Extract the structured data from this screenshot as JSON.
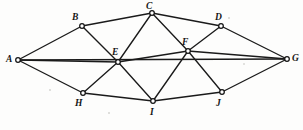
{
  "figure": {
    "width": 303,
    "height": 130,
    "background_color": "#fdfdfc",
    "line_color": "#1a1a1a",
    "vertex_fill_color": "#ffffff",
    "label_color": "#151515"
  },
  "chart_data": {
    "type": "diagram",
    "subtype": "undirected-graph",
    "title": "",
    "vertex_count": 10,
    "edge_count": 19,
    "vertices": [
      {
        "id": "A",
        "label": "A",
        "x": 18,
        "y": 60,
        "label_x": 6,
        "label_y": 55,
        "degree": 4
      },
      {
        "id": "B",
        "label": "B",
        "x": 82,
        "y": 26,
        "label_x": 72,
        "label_y": 13,
        "degree": 3
      },
      {
        "id": "C",
        "label": "C",
        "x": 152,
        "y": 13,
        "label_x": 146,
        "label_y": 2,
        "degree": 4
      },
      {
        "id": "D",
        "label": "D",
        "x": 221,
        "y": 26,
        "label_x": 215,
        "label_y": 13,
        "degree": 3
      },
      {
        "id": "E",
        "label": "E",
        "x": 118,
        "y": 62,
        "label_x": 112,
        "label_y": 48,
        "degree": 6
      },
      {
        "id": "F",
        "label": "F",
        "x": 188,
        "y": 51,
        "label_x": 182,
        "label_y": 38,
        "degree": 6
      },
      {
        "id": "G",
        "label": "G",
        "x": 287,
        "y": 59,
        "label_x": 292,
        "label_y": 54,
        "degree": 4
      },
      {
        "id": "H",
        "label": "H",
        "x": 83,
        "y": 93,
        "label_x": 75,
        "label_y": 99,
        "degree": 3
      },
      {
        "id": "I",
        "label": "I",
        "x": 153,
        "y": 101,
        "label_x": 150,
        "label_y": 108,
        "degree": 4
      },
      {
        "id": "J",
        "label": "J",
        "x": 222,
        "y": 92,
        "label_x": 216,
        "label_y": 99,
        "degree": 3
      }
    ],
    "edges": [
      {
        "from": "A",
        "to": "B"
      },
      {
        "from": "A",
        "to": "E"
      },
      {
        "from": "A",
        "to": "H"
      },
      {
        "from": "A",
        "to": "G"
      },
      {
        "from": "B",
        "to": "C"
      },
      {
        "from": "B",
        "to": "E"
      },
      {
        "from": "C",
        "to": "D"
      },
      {
        "from": "C",
        "to": "E"
      },
      {
        "from": "C",
        "to": "F"
      },
      {
        "from": "D",
        "to": "F"
      },
      {
        "from": "D",
        "to": "G"
      },
      {
        "from": "E",
        "to": "F"
      },
      {
        "from": "E",
        "to": "H"
      },
      {
        "from": "E",
        "to": "I"
      },
      {
        "from": "F",
        "to": "G"
      },
      {
        "from": "F",
        "to": "I"
      },
      {
        "from": "F",
        "to": "J"
      },
      {
        "from": "H",
        "to": "I"
      },
      {
        "from": "I",
        "to": "J"
      },
      {
        "from": "J",
        "to": "G"
      }
    ]
  }
}
